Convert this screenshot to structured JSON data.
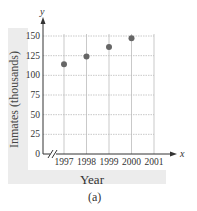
{
  "chart_data": {
    "type": "scatter",
    "title": "",
    "caption": "(a)",
    "xlabel": "Year",
    "ylabel": "Inmates (thousands)",
    "x_axis_symbol": "x",
    "y_axis_symbol": "y",
    "x_ticks": [
      "1997",
      "1998",
      "1999",
      "2000",
      "2001"
    ],
    "y_ticks": [
      0,
      25,
      50,
      75,
      100,
      125,
      150
    ],
    "ylim": [
      0,
      150
    ],
    "xlim": [
      1997,
      2001
    ],
    "axis_break": true,
    "grid": true,
    "points": [
      {
        "x": 1997,
        "y": 114
      },
      {
        "x": 1998,
        "y": 124
      },
      {
        "x": 1999,
        "y": 136
      },
      {
        "x": 2000,
        "y": 147
      }
    ],
    "colors": {
      "point": "#666666",
      "grid": "#bbbbbb",
      "axis": "#333333",
      "panel": "#ececec"
    }
  }
}
